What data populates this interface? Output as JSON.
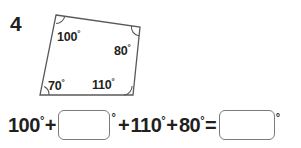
{
  "problem": {
    "number": "4"
  },
  "figure": {
    "shape_name": "quadrilateral",
    "stroke_color": "#58595b",
    "angles": [
      {
        "position": "top-left",
        "value": "100",
        "degree_symbol": "°"
      },
      {
        "position": "top-right",
        "value": "80",
        "degree_symbol": "°"
      },
      {
        "position": "bottom-left",
        "value": "70",
        "degree_symbol": "°"
      },
      {
        "position": "bottom-right",
        "value": "110",
        "degree_symbol": "°"
      }
    ]
  },
  "equation": {
    "term1": "100",
    "operator1": "+",
    "blank1_value": "",
    "blank1_degree": "°",
    "operator2": "+",
    "term3": "110",
    "operator3": "+",
    "term4": "80",
    "equals": "=",
    "blank2_value": "",
    "blank2_degree": "°",
    "degree_symbol": "°"
  }
}
